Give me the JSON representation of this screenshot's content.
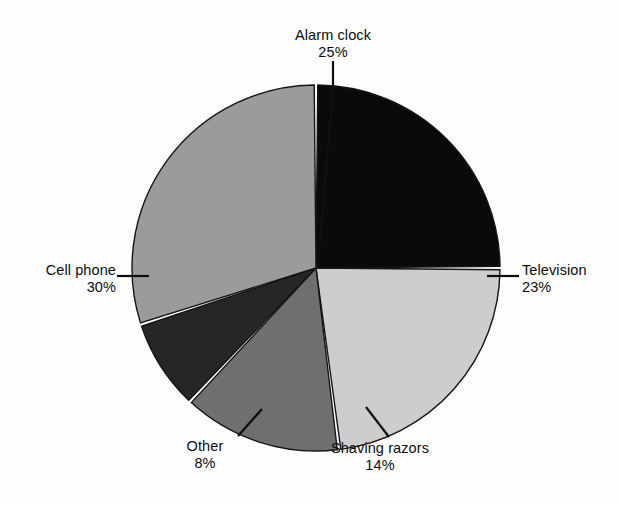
{
  "chart_data": {
    "type": "pie",
    "title": "",
    "xlabel": "",
    "ylabel": "",
    "legend_position": "none",
    "grid": false,
    "labels_show_percent": true,
    "categories": [
      "Alarm clock",
      "Television",
      "Shaving razors",
      "Other",
      "Cell phone"
    ],
    "values": [
      25,
      23,
      14,
      8,
      30
    ],
    "units": "%",
    "slices": [
      {
        "name": "Alarm clock",
        "label": "Alarm clock",
        "percent": 25,
        "percent_text": "25%",
        "color": "#0a0a0a",
        "start_angle_deg": 0,
        "end_angle_deg": 90,
        "leader": "vertical-top"
      },
      {
        "name": "Television",
        "label": "Television",
        "percent": 23,
        "percent_text": "23%",
        "color": "#cdcdcd",
        "start_angle_deg": 90,
        "end_angle_deg": 172.8,
        "leader": "horizontal-right"
      },
      {
        "name": "Shaving razors",
        "label": "Shaving razors",
        "percent": 14,
        "percent_text": "14%",
        "color": "#6f6f6f",
        "start_angle_deg": 172.8,
        "end_angle_deg": 223.2,
        "leader": "diagonal-bottom-right"
      },
      {
        "name": "Other",
        "label": "Other",
        "percent": 8,
        "percent_text": "8%",
        "color": "#262626",
        "start_angle_deg": 223.2,
        "end_angle_deg": 252,
        "leader": "diagonal-bottom-left"
      },
      {
        "name": "Cell phone",
        "label": "Cell phone",
        "percent": 30,
        "percent_text": "30%",
        "color": "#9b9b9b",
        "start_angle_deg": 252,
        "end_angle_deg": 360,
        "leader": "horizontal-left"
      }
    ],
    "colors": {
      "background": "#fdfdfd",
      "outline": "#141414",
      "separator": "#ffffff",
      "text": "#0d0d0d"
    }
  }
}
